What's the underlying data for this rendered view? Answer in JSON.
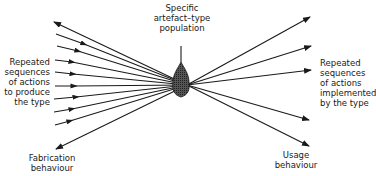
{
  "diagram": {
    "labels": {
      "center_top": "Specific\nartefact–type\npopulation",
      "left_middle": "Repeated\nsequences\nof actions\nto produce\nthe type",
      "left_bottom": "Fabrication\nbehaviour",
      "right_middle": "Repeated\nsequences\nof actions\nimplemented\nby the type",
      "right_bottom": "Usage\nbehaviour"
    },
    "center_node": {
      "shape": "spindle",
      "x": 187,
      "y": 85
    },
    "left_lines_count": 10,
    "right_arrows_count": 5,
    "colors": {
      "ink": "#1a1a1a",
      "background": "#ffffff"
    }
  }
}
